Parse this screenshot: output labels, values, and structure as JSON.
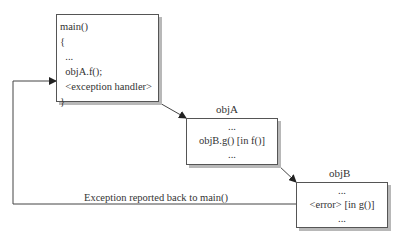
{
  "diagram": {
    "main_box": {
      "lines": [
        "main()",
        "{",
        "  ...",
        "  objA.f();",
        "  <exception handler>",
        "}"
      ]
    },
    "objA_box": {
      "title": "objA",
      "lines": [
        "...",
        "objB.g() [in f()]",
        "..."
      ]
    },
    "objB_box": {
      "title": "objB",
      "lines": [
        "...",
        "<error> [in g()]",
        "..."
      ]
    },
    "return_path": {
      "label": "Exception reported back to main()"
    },
    "colors": {
      "line": "#444444",
      "shadow": "#b8b8b8",
      "box_border": "#555555"
    }
  }
}
